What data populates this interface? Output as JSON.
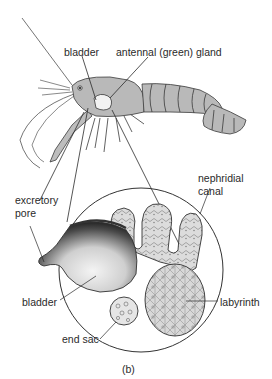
{
  "figure": {
    "panel_label": "(b)",
    "labels": {
      "bladder_top": "bladder",
      "antennal_gland": "antennal (green) gland",
      "excretory_pore_line1": "excretory",
      "excretory_pore_line2": "pore",
      "nephridial_canal_line1": "nephridial",
      "nephridial_canal_line2": "canal",
      "bladder_detail": "bladder",
      "labyrinth": "labyrinth",
      "end_sac": "end sac"
    }
  },
  "colors": {
    "body_fill": "#b9b9b9",
    "outline": "#3a3a3a",
    "gland_fill": "#f2f2f2",
    "bladder_dark": "#1a1a1a",
    "tissue_fill": "#d6d6d6"
  }
}
